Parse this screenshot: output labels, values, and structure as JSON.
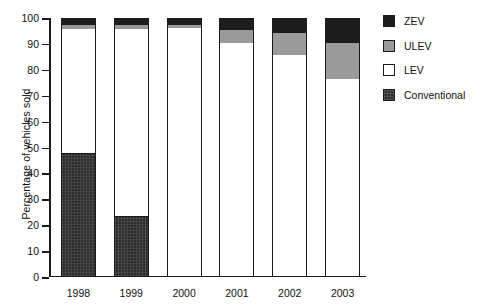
{
  "chart_data": {
    "type": "bar",
    "stacked": true,
    "title": "",
    "xlabel": "",
    "ylabel": "Percentage of vehicles sold",
    "categories": [
      "1998",
      "1999",
      "2000",
      "2001",
      "2002",
      "2003"
    ],
    "ylim": [
      0,
      100
    ],
    "ytick_labels": [
      "0",
      "10",
      "20",
      "30",
      "40",
      "50",
      "60",
      "70",
      "80",
      "90",
      "100"
    ],
    "ytick_values": [
      0,
      10,
      20,
      30,
      40,
      50,
      60,
      70,
      80,
      90,
      100
    ],
    "grid": false,
    "legend_position": "right",
    "series": [
      {
        "name": "Conventional",
        "color": "#2e2e2e",
        "values": [
          48,
          23.5,
          0,
          0,
          0,
          0
        ]
      },
      {
        "name": "LEV",
        "color": "#ffffff",
        "values": [
          48,
          72.5,
          96.5,
          90.5,
          86,
          76.5
        ]
      },
      {
        "name": "ULEV",
        "color": "#9a9a9a",
        "values": [
          2,
          2,
          1.5,
          5.5,
          9,
          14.5
        ]
      },
      {
        "name": "ZEV",
        "color": "#1d1d1d",
        "values": [
          2,
          2,
          2,
          4,
          5,
          9
        ]
      }
    ],
    "legend_entries": [
      {
        "label": "ZEV",
        "color": "#1d1d1d"
      },
      {
        "label": "ULEV",
        "color": "#9a9a9a"
      },
      {
        "label": "LEV",
        "color": "#ffffff"
      },
      {
        "label": "Conventional",
        "color": "#2e2e2e"
      }
    ]
  }
}
